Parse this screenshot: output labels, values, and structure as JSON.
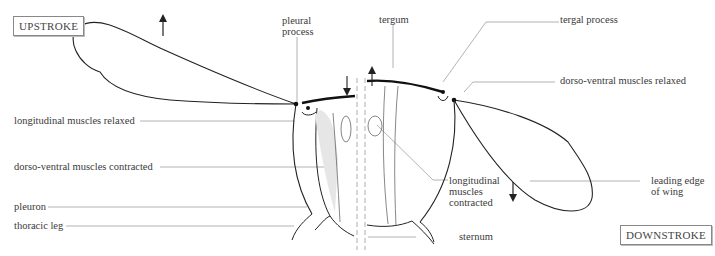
{
  "diagram": {
    "type": "insect flight mechanism (indirect flight muscles)",
    "stroke_boxes": {
      "upstroke": "UPSTROKE",
      "downstroke": "DOWNSTROKE"
    },
    "labels": {
      "pleural_process_1": "pleural",
      "pleural_process_2": "process",
      "tergum": "tergum",
      "tergal_process": "tergal process",
      "dv_relaxed": "dorso-ventral muscles relaxed",
      "long_relaxed": "longitudinal muscles relaxed",
      "dv_contracted": "dorso-ventral muscles contracted",
      "pleuron": "pleuron",
      "thoracic_leg": "thoracic leg",
      "long_contracted_1": "longitudinal",
      "long_contracted_2": "muscles",
      "long_contracted_3": "contracted",
      "leading_edge_1": "leading edge",
      "leading_edge_2": "of wing",
      "sternum": "sternum"
    },
    "colors": {
      "line": "#222222",
      "leader": "#9a9a9a",
      "muscle_fill": "#e6e6e6"
    }
  }
}
